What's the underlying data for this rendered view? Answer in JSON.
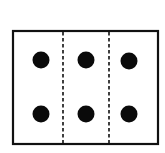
{
  "diagram": {
    "frame": {
      "x": 13,
      "y": 31,
      "width": 145,
      "height": 113,
      "stroke": "#111111"
    },
    "dividers": [
      {
        "x": 63,
        "style": "dashed"
      },
      {
        "x": 109,
        "style": "dashed"
      }
    ],
    "columns": 3,
    "rows": 2,
    "dots": [
      {
        "cx": 41,
        "cy": 60,
        "r": 8.5
      },
      {
        "cx": 86,
        "cy": 60,
        "r": 8.5
      },
      {
        "cx": 129,
        "cy": 61,
        "r": 8.5
      },
      {
        "cx": 41,
        "cy": 114,
        "r": 8.5
      },
      {
        "cx": 86,
        "cy": 114,
        "r": 8.5
      },
      {
        "cx": 129,
        "cy": 114,
        "r": 8.5
      }
    ],
    "dot_color": "#0a0a0a",
    "dot_count": 6
  }
}
